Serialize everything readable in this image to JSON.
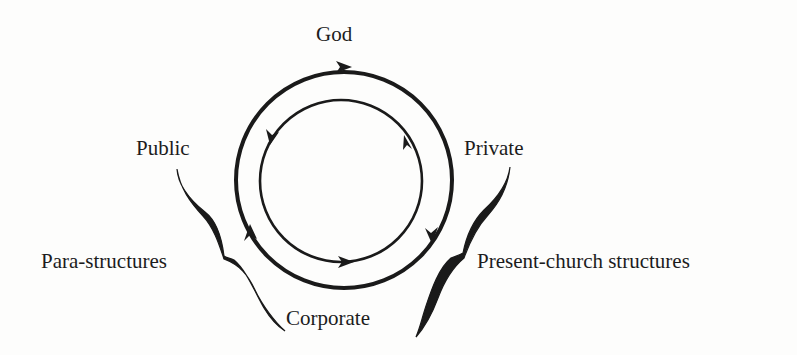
{
  "diagram": {
    "labels": {
      "top": "God",
      "upper_left": "Public",
      "upper_right": "Private",
      "left": "Para-structures",
      "right": "Present-church structures",
      "bottom": "Corporate"
    },
    "outer_circle": {
      "center": [
        344,
        180
      ],
      "radius": 108,
      "stroke_width": 4,
      "direction": "clockwise",
      "arrows": [
        "top",
        "lower-right",
        "lower-left"
      ]
    },
    "inner_circle": {
      "center": [
        341,
        181
      ],
      "radius": 81,
      "stroke_width": 2.6,
      "direction": "counter-clockwise",
      "arrows": [
        "upper-left",
        "upper-right",
        "bottom"
      ]
    },
    "braces": {
      "left": {
        "groups": [
          "Public",
          "Corporate"
        ],
        "label": "Para-structures"
      },
      "right": {
        "groups": [
          "Private",
          "Corporate"
        ],
        "label": "Present-church structures"
      }
    },
    "colors": {
      "ink": "#1a1a1a",
      "background": "#fdfdfc"
    }
  }
}
